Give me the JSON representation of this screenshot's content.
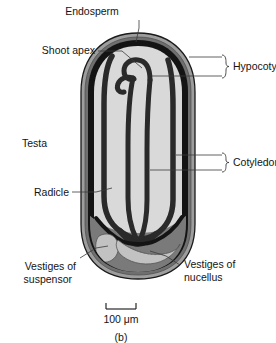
{
  "figure": {
    "caption": "(b)",
    "scale_bar": {
      "label": "100 μm",
      "value": 100,
      "unit": "μm"
    }
  },
  "labels": {
    "endosperm": "Endosperm",
    "shoot_apex": "Shoot apex",
    "hypocotyls": "Hypocotyls",
    "testa": "Testa",
    "cotyledons": "Cotyledons",
    "radicle": "Radicle",
    "vestiges_suspensor_line1": "Vestiges of",
    "vestiges_suspensor_line2": "suspensor",
    "vestiges_nucellus_line1": "Vestiges of",
    "vestiges_nucellus_line2": "nucellus"
  },
  "colors": {
    "background": "#ffffff",
    "testa_outer": "#9d9d9d",
    "testa_mid": "#6f6f6f",
    "endosperm_band": "#141414",
    "embryo_fill": "#d9d9d9",
    "basal_region": "#7a7a7a",
    "vestige_fill": "#c2c2c2",
    "outline": "#1a1a1a",
    "leader_line": "#3a3a3a",
    "text": "#141414"
  }
}
